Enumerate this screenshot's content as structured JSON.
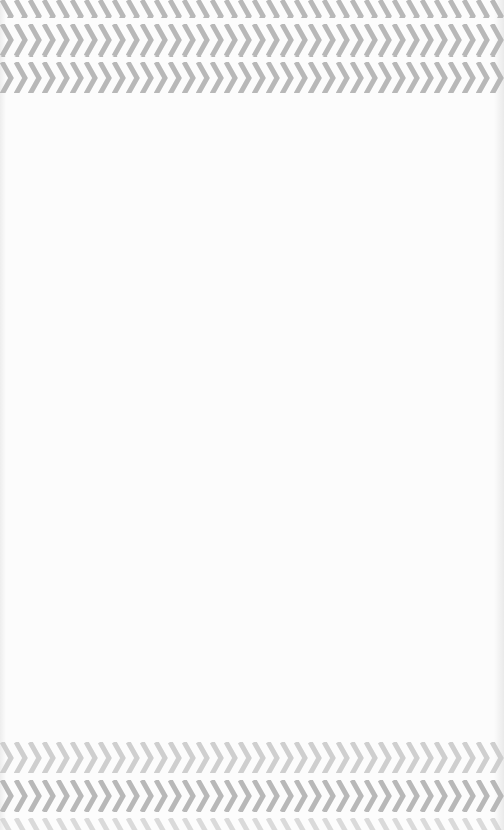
{
  "scene": {
    "description": "Photographed paper surface with printed gray chevron border bands at top and bottom; blank white center",
    "colors": {
      "paper": "#fcfcfc",
      "chevron": "#b5b5b5",
      "chevron_light": "#cfcfcf"
    },
    "top_bands": [
      {
        "top": 0,
        "height": 18,
        "direction": "right"
      },
      {
        "top": 24,
        "height": 33,
        "direction": "right"
      },
      {
        "top": 62,
        "height": 31,
        "direction": "right"
      }
    ],
    "bottom_bands": [
      {
        "top": 742,
        "height": 31,
        "direction": "right"
      },
      {
        "top": 780,
        "height": 32,
        "direction": "right"
      },
      {
        "top": 818,
        "height": 12,
        "direction": "right"
      }
    ]
  }
}
